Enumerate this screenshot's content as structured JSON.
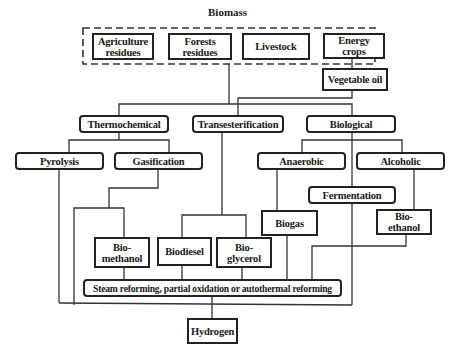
{
  "diagram": {
    "title": "Biomass",
    "sources": [
      {
        "label": "Agriculture residues",
        "line1": "Agriculture",
        "line2": "residues"
      },
      {
        "label": "Forests residues",
        "line1": "Forests",
        "line2": "residues"
      },
      {
        "label": "Livestock"
      },
      {
        "label": "Energy crops",
        "line1": "Energy",
        "line2": "crops"
      }
    ],
    "intermediate": {
      "vegetable_oil": "Vegetable oil"
    },
    "pathways": {
      "thermochemical": "Thermochemical",
      "transesterification": "Transesterification",
      "biological": "Biological"
    },
    "processes": {
      "pyrolysis": "Pyrolysis",
      "gasification": "Gasification",
      "anaerobic": "Anaerobic",
      "alcoholic": "Alcoholic",
      "fermentation": "Fermentation"
    },
    "products": {
      "biomethanol": {
        "line1": "Bio-",
        "line2": "methanol"
      },
      "biodiesel": "Biodiesel",
      "bioglycerol": {
        "line1": "Bio-",
        "line2": "glycerol"
      },
      "biogas": "Biogas",
      "bioethanol": {
        "line1": "Bio-",
        "line2": "ethanol"
      }
    },
    "reforming": "Steam reforming, partial oxidation or autothermal reforming",
    "output": "Hydrogen",
    "colors": {
      "line": "#333333",
      "border": "#222222",
      "background": "#ffffff"
    }
  }
}
